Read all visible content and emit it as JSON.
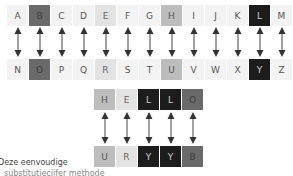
{
  "alphabet": {
    "top": [
      {
        "letter": "A",
        "shade": "none"
      },
      {
        "letter": "B",
        "shade": "dark"
      },
      {
        "letter": "C",
        "shade": "none"
      },
      {
        "letter": "D",
        "shade": "none"
      },
      {
        "letter": "E",
        "shade": "light"
      },
      {
        "letter": "F",
        "shade": "none"
      },
      {
        "letter": "G",
        "shade": "none"
      },
      {
        "letter": "H",
        "shade": "mid"
      },
      {
        "letter": "I",
        "shade": "none"
      },
      {
        "letter": "J",
        "shade": "none"
      },
      {
        "letter": "K",
        "shade": "none"
      },
      {
        "letter": "L",
        "shade": "black"
      },
      {
        "letter": "M",
        "shade": "none"
      }
    ],
    "bottom": [
      {
        "letter": "N",
        "shade": "none"
      },
      {
        "letter": "O",
        "shade": "dark"
      },
      {
        "letter": "P",
        "shade": "none"
      },
      {
        "letter": "Q",
        "shade": "none"
      },
      {
        "letter": "R",
        "shade": "light"
      },
      {
        "letter": "S",
        "shade": "none"
      },
      {
        "letter": "T",
        "shade": "none"
      },
      {
        "letter": "U",
        "shade": "mid"
      },
      {
        "letter": "V",
        "shade": "none"
      },
      {
        "letter": "W",
        "shade": "none"
      },
      {
        "letter": "X",
        "shade": "none"
      },
      {
        "letter": "Y",
        "shade": "black"
      },
      {
        "letter": "Z",
        "shade": "none"
      }
    ]
  },
  "example": {
    "plain": [
      {
        "letter": "H",
        "shade": "mid"
      },
      {
        "letter": "E",
        "shade": "light"
      },
      {
        "letter": "L",
        "shade": "black"
      },
      {
        "letter": "L",
        "shade": "black"
      },
      {
        "letter": "O",
        "shade": "dark"
      }
    ],
    "cipher": [
      {
        "letter": "U",
        "shade": "mid"
      },
      {
        "letter": "R",
        "shade": "light"
      },
      {
        "letter": "Y",
        "shade": "black"
      },
      {
        "letter": "Y",
        "shade": "black"
      },
      {
        "letter": "B",
        "shade": "dark"
      }
    ]
  },
  "colors": {
    "none": "#f3f3f3",
    "light": "#e3e3e3",
    "mid": "#bdbdbd",
    "dark": "#6a6a6a",
    "black": "#1c1c1c"
  },
  "caption": {
    "line1": "Deze eenvoudige",
    "line2": "substitutiecijfer methode"
  }
}
